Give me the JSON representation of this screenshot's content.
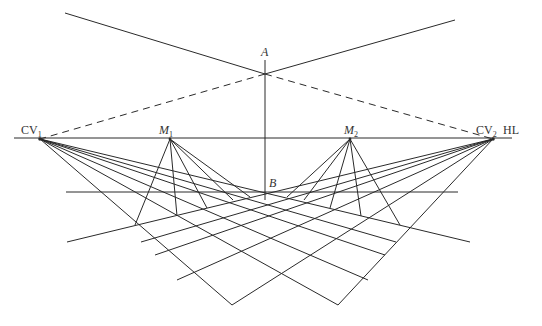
{
  "figure": {
    "type": "two-point perspective construction with measuring points",
    "line_color": "#2a2a2a",
    "background": "#ffffff"
  },
  "labels": {
    "A": "A",
    "B": "B",
    "CV1": {
      "main": "CV",
      "sub": "1"
    },
    "CV2": {
      "main": "CV",
      "sub": "2"
    },
    "M1": {
      "main": "M",
      "sub": "1"
    },
    "M2": {
      "main": "M",
      "sub": "2"
    },
    "HL": "HL"
  },
  "points": {
    "CV1": [
      40,
      139
    ],
    "M1": [
      170,
      139
    ],
    "M2": [
      350,
      139
    ],
    "CV2": [
      493,
      139
    ],
    "A": [
      265,
      74
    ],
    "B": [
      265,
      192
    ]
  }
}
